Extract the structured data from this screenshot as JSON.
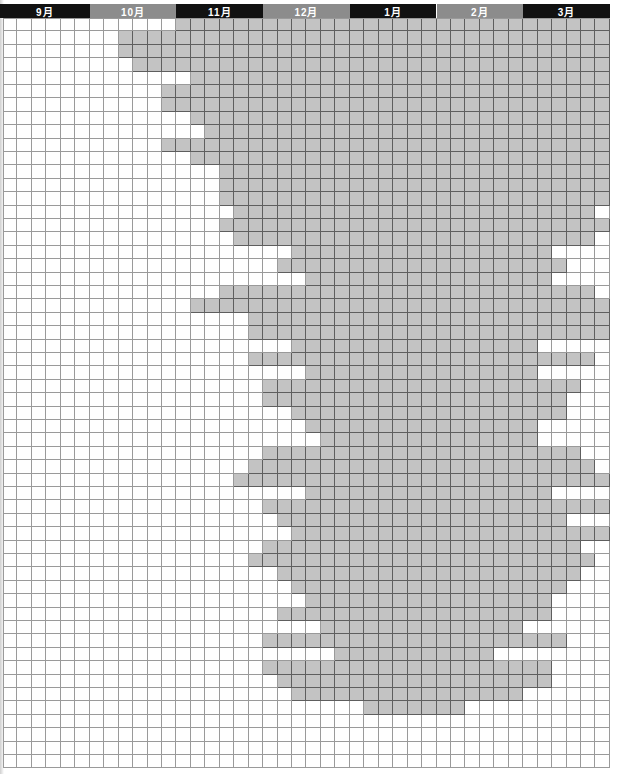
{
  "chart_data": {
    "type": "heatmap",
    "title": "",
    "xlabel": "",
    "ylabel": "",
    "months": [
      {
        "label": "9月",
        "style": "dark"
      },
      {
        "label": "10月",
        "style": "light"
      },
      {
        "label": "11月",
        "style": "dark"
      },
      {
        "label": "12月",
        "style": "light"
      },
      {
        "label": "1月",
        "style": "dark"
      },
      {
        "label": "2月",
        "style": "light"
      },
      {
        "label": "3月",
        "style": "dark"
      }
    ],
    "columns_per_month": 6,
    "total_columns": 42,
    "total_rows": 56,
    "filled_color": "#c3c3c3",
    "empty_color": "#ffffff",
    "rows": [
      [
        12,
        41
      ],
      [
        8,
        41
      ],
      [
        8,
        41
      ],
      [
        9,
        41
      ],
      [
        13,
        41
      ],
      [
        11,
        41
      ],
      [
        11,
        41
      ],
      [
        13,
        41
      ],
      [
        14,
        41
      ],
      [
        11,
        41
      ],
      [
        13,
        41
      ],
      [
        15,
        41
      ],
      [
        15,
        41
      ],
      [
        15,
        41
      ],
      [
        16,
        40
      ],
      [
        15,
        41
      ],
      [
        16,
        40
      ],
      [
        20,
        37
      ],
      [
        19,
        38
      ],
      [
        21,
        37
      ],
      [
        15,
        40
      ],
      [
        13,
        41
      ],
      [
        17,
        41
      ],
      [
        17,
        41
      ],
      [
        20,
        36
      ],
      [
        17,
        40
      ],
      [
        21,
        36
      ],
      [
        18,
        39
      ],
      [
        18,
        38
      ],
      [
        20,
        38
      ],
      [
        21,
        36
      ],
      [
        22,
        36
      ],
      [
        18,
        39
      ],
      [
        17,
        40
      ],
      [
        16,
        41
      ],
      [
        21,
        37
      ],
      [
        18,
        41
      ],
      [
        19,
        38
      ],
      [
        20,
        41
      ],
      [
        18,
        39
      ],
      [
        17,
        40
      ],
      [
        19,
        39
      ],
      [
        20,
        38
      ],
      [
        21,
        37
      ],
      [
        19,
        37
      ],
      [
        22,
        35
      ],
      [
        18,
        38
      ],
      [
        23,
        33
      ],
      [
        18,
        37
      ],
      [
        19,
        37
      ],
      [
        20,
        35
      ],
      [
        25,
        31
      ],
      null,
      null,
      null,
      null
    ]
  },
  "colors": {
    "header_dark": "#111111",
    "header_light": "#8c8c8c",
    "fill": "#c3c3c3",
    "grid_line": "#9a9a9a",
    "grid_line_on_fill": "#5e5e5e"
  }
}
